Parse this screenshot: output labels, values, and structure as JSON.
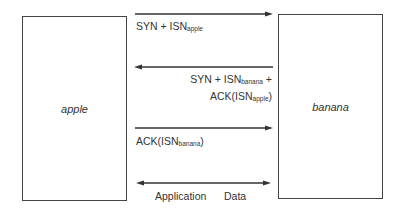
{
  "nodes": {
    "left": {
      "label": "apple"
    },
    "right": {
      "label": "banana"
    }
  },
  "messages": [
    {
      "direction": "right",
      "text": "SYN + ISN",
      "sub": "apple"
    },
    {
      "direction": "left",
      "line1_text": "SYN + ISN",
      "line1_sub": "banana",
      "line1_suffix": " +",
      "line2_text": "ACK(ISN",
      "line2_sub": "apple",
      "line2_suffix": ")"
    },
    {
      "direction": "right",
      "text": "ACK(ISN",
      "sub": "banana",
      "suffix": ")"
    },
    {
      "direction": "both",
      "label_left": "Application",
      "label_right": "Data"
    }
  ],
  "colors": {
    "line": "#333333",
    "box_border": "#444444",
    "text": "#333333"
  }
}
